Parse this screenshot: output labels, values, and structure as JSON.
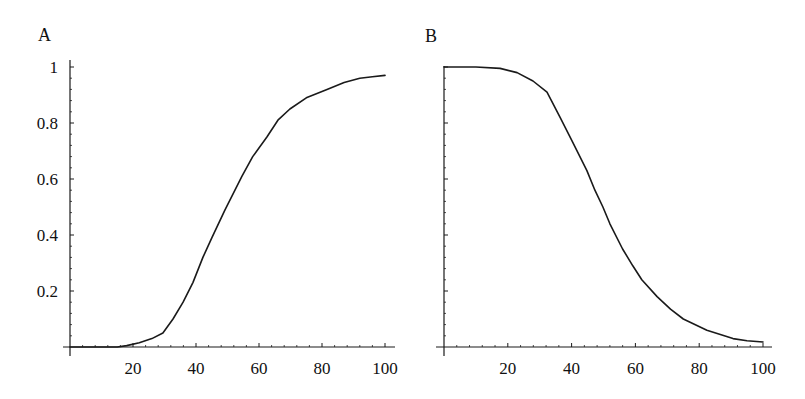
{
  "chart_data": [
    {
      "type": "line",
      "panel_label": "A",
      "title": "",
      "xlabel": "",
      "ylabel": "",
      "xlim": [
        0,
        100
      ],
      "ylim": [
        0,
        1
      ],
      "grid": false,
      "x_ticks": [
        20,
        40,
        60,
        80,
        100
      ],
      "x_tick_labels": [
        "20",
        "40",
        "60",
        "80",
        "100"
      ],
      "y_ticks": [
        0.2,
        0.4,
        0.6,
        0.8,
        1
      ],
      "y_tick_labels": [
        "0.2",
        "0.4",
        "0.6",
        "0.8",
        "1"
      ],
      "series": [
        {
          "name": "A",
          "x": [
            0,
            10,
            15,
            18,
            22,
            26,
            29.5,
            32.7,
            35.9,
            39,
            42.2,
            45,
            49.2,
            54.6,
            58,
            62.5,
            66,
            69.8,
            75,
            81.6,
            87,
            92,
            96,
            100
          ],
          "y": [
            0,
            0,
            0,
            0.005,
            0.015,
            0.03,
            0.05,
            0.1,
            0.16,
            0.23,
            0.32,
            0.39,
            0.49,
            0.61,
            0.68,
            0.75,
            0.81,
            0.85,
            0.89,
            0.92,
            0.945,
            0.96,
            0.965,
            0.97
          ]
        }
      ]
    },
    {
      "type": "line",
      "panel_label": "B",
      "title": "",
      "xlabel": "",
      "ylabel": "",
      "xlim": [
        0,
        100
      ],
      "ylim": [
        0,
        1
      ],
      "grid": false,
      "x_ticks": [
        20,
        40,
        60,
        80,
        100
      ],
      "x_tick_labels": [
        "20",
        "40",
        "60",
        "80",
        "100"
      ],
      "y_ticks": [
        0.2,
        0.4,
        0.6,
        0.8,
        1
      ],
      "y_tick_labels": [],
      "series": [
        {
          "name": "B",
          "x": [
            0,
            10,
            17.6,
            22.9,
            27.9,
            32.3,
            36.4,
            40.4,
            44.8,
            47.3,
            49.8,
            52,
            56,
            59.2,
            62,
            66.8,
            71,
            75,
            82.4,
            90.6,
            95,
            100
          ],
          "y": [
            1,
            1,
            0.995,
            0.98,
            0.95,
            0.91,
            0.82,
            0.73,
            0.63,
            0.56,
            0.5,
            0.44,
            0.35,
            0.29,
            0.24,
            0.18,
            0.135,
            0.1,
            0.06,
            0.03,
            0.022,
            0.018
          ]
        }
      ]
    }
  ]
}
